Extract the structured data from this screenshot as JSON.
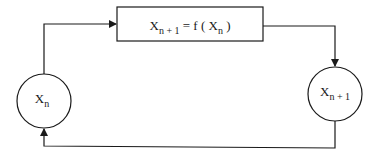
{
  "diagram": {
    "type": "feedback-loop",
    "nodes": {
      "current_state": {
        "main": "X",
        "sub": "n"
      },
      "next_state": {
        "main": "X",
        "sub": "n + 1"
      },
      "map_box": {
        "lhs_main": "X",
        "lhs_sub": "n + 1",
        "eq": " = f ( ",
        "arg_main": "X",
        "arg_sub": "n",
        "close": " )"
      }
    },
    "edges": [
      {
        "from": "current_state",
        "to": "map_box"
      },
      {
        "from": "map_box",
        "to": "next_state"
      },
      {
        "from": "next_state",
        "to": "current_state"
      }
    ],
    "colors": {
      "stroke": "#1a1a1a",
      "background": "#ffffff"
    }
  }
}
